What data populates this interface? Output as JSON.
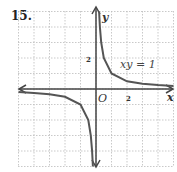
{
  "problem_number": "15.",
  "chart_data": {
    "type": "line",
    "title": "",
    "equation_label": "xy = 1",
    "xlabel": "x",
    "ylabel": "y",
    "origin_label": "O",
    "x_tick_labels": [
      {
        "value": 2,
        "label": "2"
      }
    ],
    "y_tick_labels": [
      {
        "value": 2,
        "label": "2"
      }
    ],
    "xlim": [
      -5,
      5
    ],
    "ylim": [
      -5,
      5
    ],
    "grid": true,
    "series": [
      {
        "name": "xy = 1 (Quadrant I branch)",
        "points": [
          [
            0.2,
            5
          ],
          [
            0.25,
            4
          ],
          [
            0.333,
            3
          ],
          [
            0.5,
            2
          ],
          [
            1,
            1
          ],
          [
            2,
            0.5
          ],
          [
            3,
            0.333
          ],
          [
            4,
            0.25
          ],
          [
            5,
            0.2
          ]
        ]
      },
      {
        "name": "xy = 1 (Quadrant III branch)",
        "points": [
          [
            -5,
            -0.2
          ],
          [
            -4,
            -0.25
          ],
          [
            -3,
            -0.333
          ],
          [
            -2,
            -0.5
          ],
          [
            -1,
            -1
          ],
          [
            -0.5,
            -2
          ],
          [
            -0.333,
            -3
          ],
          [
            -0.25,
            -4
          ],
          [
            -0.2,
            -5
          ]
        ]
      }
    ]
  }
}
